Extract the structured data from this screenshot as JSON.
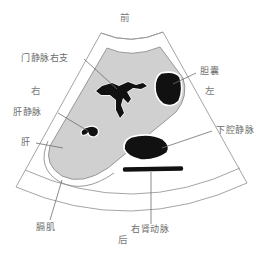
{
  "figure": {
    "kind": "ultrasound-sector-diagram",
    "colors": {
      "background": "#ffffff",
      "liver_fill": "#d0d0d0",
      "vessel_fill": "#111111",
      "outline": "#8c8c8c",
      "label_text": "#6b6b6b",
      "leader_line": "#6f6f6f",
      "halo": "#ffffff"
    }
  },
  "orientation": {
    "anterior": "前",
    "posterior": "后",
    "right": "右",
    "left": "左"
  },
  "labels": {
    "portal_vein_right_branch": "门静脉右支",
    "gallbladder": "胆囊",
    "hepatic_vein": "肝静脉",
    "liver": "肝",
    "inferior_vena_cava": "下腔静脉",
    "diaphragm": "膈肌",
    "right_renal_artery": "右肾动脉"
  },
  "structures": [
    {
      "name": "liver",
      "label": "肝",
      "fill": "#d0d0d0"
    },
    {
      "name": "portal-vein-right-branch",
      "label": "门静脉右支",
      "fill": "#111111"
    },
    {
      "name": "hepatic-vein",
      "label": "肝静脉",
      "fill": "#111111"
    },
    {
      "name": "gallbladder",
      "label": "胆囊",
      "fill": "#111111"
    },
    {
      "name": "inferior-vena-cava",
      "label": "下腔静脉",
      "fill": "#111111"
    },
    {
      "name": "right-renal-artery",
      "label": "右肾动脉",
      "fill": "#111111"
    },
    {
      "name": "diaphragm",
      "label": "膈肌",
      "fill": "none"
    }
  ]
}
